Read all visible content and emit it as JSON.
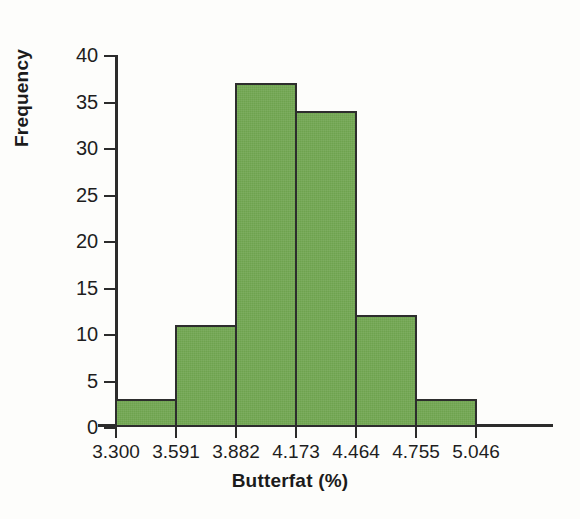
{
  "chart_data": {
    "type": "bar",
    "title": "",
    "subtitle": "",
    "xlabel": "Butterfat (%)",
    "ylabel": "Frequency",
    "categories": [
      "3.300–3.591",
      "3.591–3.882",
      "3.882–4.173",
      "4.173–4.464",
      "4.464–4.755",
      "4.755–5.046",
      "5.046–5.337"
    ],
    "values": [
      3,
      11,
      37,
      34,
      12,
      3,
      0
    ],
    "bin_edges": [
      3.3,
      3.591,
      3.882,
      4.173,
      4.464,
      4.755,
      5.046
    ],
    "bars": [
      {
        "bin_start": "3.300",
        "bin_end": "3.591",
        "value": 3
      },
      {
        "bin_start": "3.591",
        "bin_end": "3.882",
        "value": 11
      },
      {
        "bin_start": "3.882",
        "bin_end": "4.173",
        "value": 37
      },
      {
        "bin_start": "4.173",
        "bin_end": "4.464",
        "value": 34
      },
      {
        "bin_start": "4.464",
        "bin_end": "4.755",
        "value": 12
      },
      {
        "bin_start": "4.755",
        "bin_end": "5.046",
        "value": 3
      }
    ],
    "xticklabels": [
      "3.300",
      "3.591",
      "3.882",
      "4.173",
      "4.464",
      "4.755",
      "5.046"
    ],
    "xtickvalues": [
      3.3,
      3.591,
      3.882,
      4.173,
      4.464,
      4.755,
      5.046
    ],
    "yticklabels": [
      "0",
      "5",
      "10",
      "15",
      "20",
      "25",
      "30",
      "35",
      "40"
    ],
    "ytickvalues": [
      0,
      5,
      10,
      15,
      20,
      25,
      30,
      35,
      40
    ],
    "ylim": [
      0,
      40
    ],
    "xlim": [
      3.3,
      5.337
    ],
    "grid": false,
    "legend": null,
    "colors": {
      "bar_fill": "#6ea34e",
      "bar_edge": "#2d2d2d",
      "axis": "#2b2b2b",
      "text": "#1e1e1e",
      "background": "#fdfdfb"
    }
  }
}
